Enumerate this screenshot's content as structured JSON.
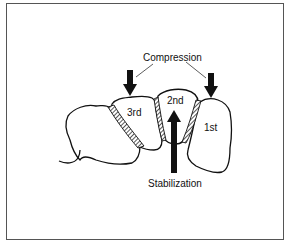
{
  "figure": {
    "labels": {
      "compression": "Compression",
      "stabilization": "Stabilization"
    },
    "segments": [
      {
        "id": "first",
        "label": "1st"
      },
      {
        "id": "second",
        "label": "2nd"
      },
      {
        "id": "third",
        "label": "3rd"
      }
    ],
    "arrows": [
      {
        "id": "compression-arrow-third",
        "direction": "down",
        "meaning": "compression"
      },
      {
        "id": "compression-arrow-first",
        "direction": "down",
        "meaning": "compression"
      },
      {
        "id": "stabilization-arrow-second",
        "direction": "up",
        "meaning": "stabilization"
      }
    ],
    "colors": {
      "stroke": "#111111",
      "background": "#ffffff",
      "frame": "#555555"
    }
  }
}
